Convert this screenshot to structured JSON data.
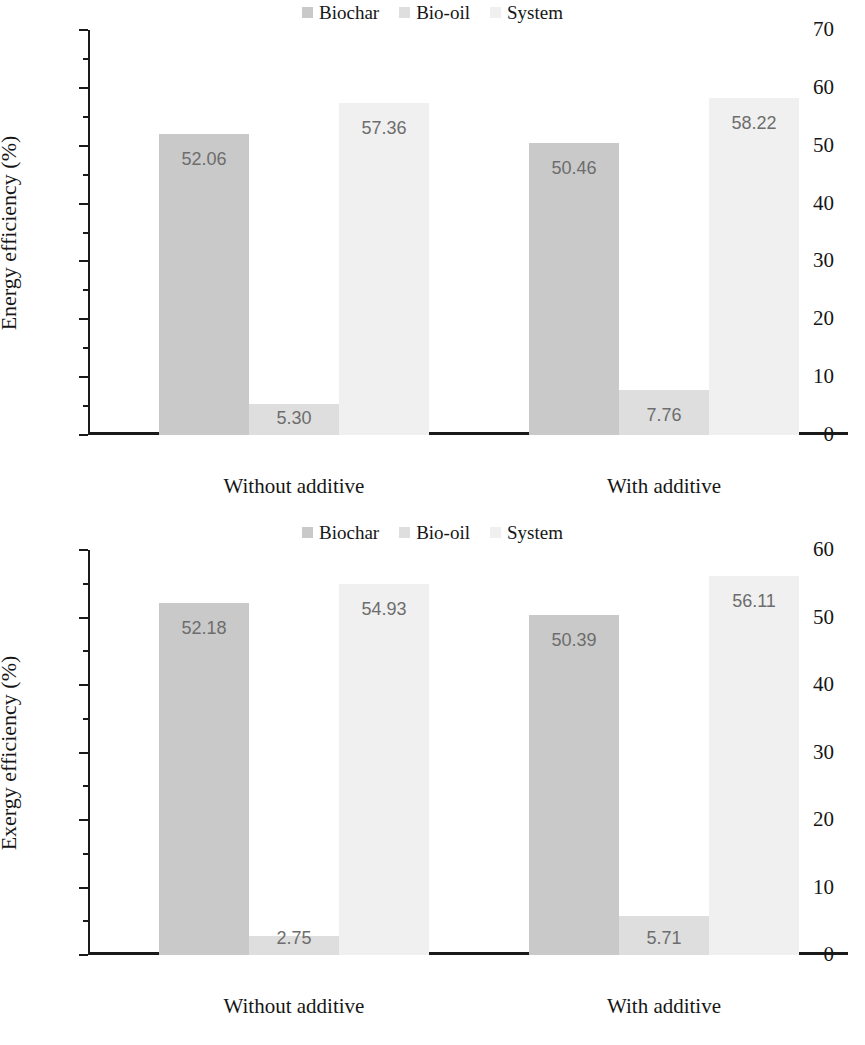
{
  "charts": [
    {
      "id": "energy",
      "ylabel": "Energy efficiency (%)",
      "legend": [
        {
          "label": "Biochar",
          "color": "#c9c9c9"
        },
        {
          "label": "Bio-oil",
          "color": "#dedede"
        },
        {
          "label": "System",
          "color": "#f0f0f0"
        }
      ],
      "categories": [
        "Without additive",
        "With additive"
      ],
      "yticks": [
        "0",
        "10",
        "20",
        "30",
        "40",
        "50",
        "60",
        "70"
      ],
      "values": [
        [
          "52.06",
          "5.30",
          "57.36"
        ],
        [
          "50.46",
          "7.76",
          "58.22"
        ]
      ]
    },
    {
      "id": "exergy",
      "ylabel": "Exergy efficiency (%)",
      "legend": [
        {
          "label": "Biochar",
          "color": "#c9c9c9"
        },
        {
          "label": "Bio-oil",
          "color": "#dedede"
        },
        {
          "label": "System",
          "color": "#f0f0f0"
        }
      ],
      "categories": [
        "Without additive",
        "With additive"
      ],
      "yticks": [
        "0",
        "10",
        "20",
        "30",
        "40",
        "50",
        "60"
      ],
      "values": [
        [
          "52.18",
          "2.75",
          "54.93"
        ],
        [
          "50.39",
          "5.71",
          "56.11"
        ]
      ]
    }
  ],
  "chart_data": [
    {
      "type": "bar",
      "title": "",
      "xlabel": "",
      "ylabel": "Energy efficiency (%)",
      "ylim": [
        0,
        70
      ],
      "ytick_step": 10,
      "minor_tick_step": 5,
      "grid": false,
      "legend_position": "top-center",
      "categories": [
        "Without additive",
        "With additive"
      ],
      "series": [
        {
          "name": "Biochar",
          "color": "#c9c9c9",
          "values": [
            52.06,
            50.46
          ]
        },
        {
          "name": "Bio-oil",
          "color": "#dedede",
          "values": [
            5.3,
            7.76
          ]
        },
        {
          "name": "System",
          "color": "#f0f0f0",
          "values": [
            57.36,
            58.22
          ]
        }
      ]
    },
    {
      "type": "bar",
      "title": "",
      "xlabel": "",
      "ylabel": "Exergy efficiency (%)",
      "ylim": [
        0,
        60
      ],
      "ytick_step": 10,
      "minor_tick_step": 5,
      "grid": false,
      "legend_position": "top-center",
      "categories": [
        "Without additive",
        "With additive"
      ],
      "series": [
        {
          "name": "Biochar",
          "color": "#c9c9c9",
          "values": [
            52.18,
            50.39
          ]
        },
        {
          "name": "Bio-oil",
          "color": "#dedede",
          "values": [
            2.75,
            5.71
          ]
        },
        {
          "name": "System",
          "color": "#f0f0f0",
          "values": [
            54.93,
            56.11
          ]
        }
      ]
    }
  ]
}
